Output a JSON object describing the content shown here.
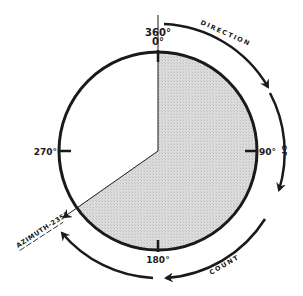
{
  "diagram": {
    "center": [
      158,
      151
    ],
    "radius": 99,
    "outer_arrow_radius": 127,
    "azimuth_degrees": 235,
    "colors": {
      "ink": "#1a1a1a",
      "sector_fill": "#d9d9d9",
      "background": "#ffffff"
    },
    "degree_labels": {
      "top_360": "360°",
      "top_0": "0°",
      "right": "90°",
      "bottom": "180°",
      "left": "270°"
    },
    "azimuth_label": "AZIMUTH-235°",
    "arrow_words": {
      "word1": "DIRECTION",
      "word2": "OF",
      "word3": "COUNT"
    }
  }
}
